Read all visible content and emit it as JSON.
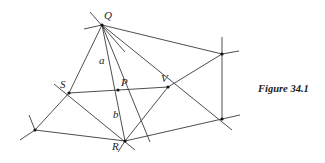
{
  "figure": {
    "caption": "Figure 34.1",
    "caption_pos": [
      258,
      92
    ]
  },
  "points": [
    {
      "id": "Q",
      "label": "Q",
      "x": 102,
      "y": 25,
      "lx": 104,
      "ly": 19
    },
    {
      "id": "S",
      "label": "S",
      "x": 69,
      "y": 93,
      "lx": 60,
      "ly": 88
    },
    {
      "id": "P",
      "label": "P",
      "x": 118,
      "y": 90,
      "lx": 121,
      "ly": 86
    },
    {
      "id": "V",
      "label": "V",
      "x": 168,
      "y": 87,
      "lx": 161,
      "ly": 82
    },
    {
      "id": "R",
      "label": "R",
      "x": 125,
      "y": 141,
      "lx": 112,
      "ly": 150
    },
    {
      "id": "TR",
      "label": "",
      "x": 222,
      "y": 54
    },
    {
      "id": "BR",
      "label": "",
      "x": 222,
      "y": 119
    },
    {
      "id": "BL",
      "label": "",
      "x": 35,
      "y": 130
    }
  ],
  "segment_labels": [
    {
      "id": "a",
      "label": "a",
      "x": 99,
      "y": 64
    },
    {
      "id": "b",
      "label": "b",
      "x": 113,
      "y": 118
    }
  ],
  "lines": [
    [
      90,
      12,
      125,
      52
    ],
    [
      84,
      29,
      102,
      25
    ],
    [
      102,
      25,
      150,
      142
    ],
    [
      69,
      93,
      102,
      25
    ],
    [
      102,
      25,
      125,
      141
    ],
    [
      102,
      25,
      232,
      130
    ],
    [
      102,
      25,
      222,
      54
    ],
    [
      69,
      93,
      168,
      87
    ],
    [
      54,
      84,
      135,
      150
    ],
    [
      69,
      93,
      35,
      130
    ],
    [
      125,
      141,
      168,
      87
    ],
    [
      168,
      87,
      222,
      54
    ],
    [
      222,
      54,
      239,
      51
    ],
    [
      222,
      37,
      222,
      119
    ],
    [
      125,
      141,
      222,
      119
    ],
    [
      222,
      119,
      240,
      115
    ],
    [
      125,
      141,
      35,
      130
    ],
    [
      35,
      130,
      20,
      140
    ],
    [
      35,
      130,
      29,
      115
    ],
    [
      118,
      152,
      125,
      141
    ]
  ]
}
